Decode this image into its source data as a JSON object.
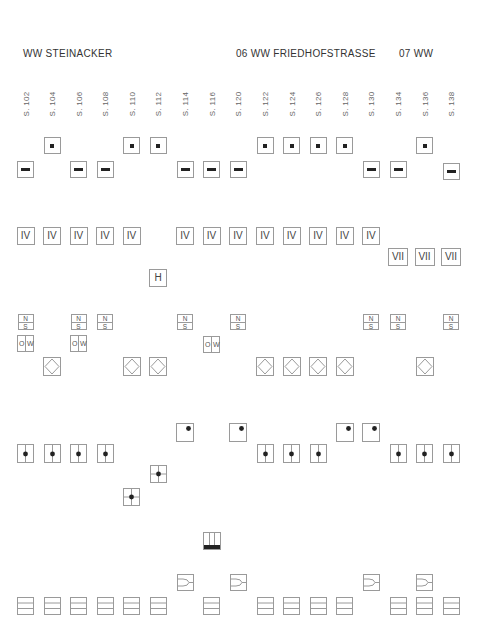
{
  "header": {
    "left_title": "WW  STEINACKER",
    "right_title": "06 WW FRIEDHOFSTRASSE",
    "right_suffix": "07 WW"
  },
  "columns": [
    "S. 102",
    "S. 104",
    "S. 106",
    "S. 108",
    "S. 110",
    "S. 112",
    "S. 114",
    "S. 116",
    "S. 120",
    "S. 122",
    "S. 124",
    "S. 126",
    "S. 128",
    "S. 130",
    "S. 134",
    "S. 136",
    "S. 138"
  ],
  "column_x": [
    25.5,
    52,
    78.5,
    105,
    131.5,
    158,
    185,
    211.5,
    238,
    265,
    291.5,
    318,
    344.5,
    371,
    398,
    424.5,
    451
  ],
  "rows": {
    "dot_top": {
      "symbol": "dot-square",
      "columns": [
        "S. 104",
        "S. 110",
        "S. 112",
        "S. 122",
        "S. 124",
        "S. 126",
        "S. 128",
        "S. 136"
      ]
    },
    "dash": {
      "symbol": "dash-square",
      "columns": [
        "S. 102",
        "S. 106",
        "S. 108",
        "S. 114",
        "S. 116",
        "S. 120",
        "S. 130",
        "S. 134",
        "S. 138"
      ]
    },
    "roman_iv": {
      "label": "IV",
      "columns": [
        "S. 102",
        "S. 104",
        "S. 106",
        "S. 108",
        "S. 110",
        "S. 114",
        "S. 116",
        "S. 120",
        "S. 122",
        "S. 124",
        "S. 126",
        "S. 128",
        "S. 130"
      ]
    },
    "roman_vii": {
      "label": "VII",
      "columns": [
        "S. 134",
        "S. 136",
        "S. 138"
      ]
    },
    "letter_h": {
      "label": "H",
      "columns": [
        "S. 112"
      ]
    },
    "north_south": {
      "top": "N",
      "bottom": "S",
      "columns": [
        "S. 102",
        "S. 106",
        "S. 108",
        "S. 114",
        "S. 120",
        "S. 130",
        "S. 134",
        "S. 138"
      ]
    },
    "east_west": {
      "left": "O",
      "right": "W",
      "columns": [
        "S. 102",
        "S. 106",
        "S. 116"
      ]
    },
    "diamond": {
      "symbol": "diamond-in-square",
      "columns": [
        "S. 104",
        "S. 110",
        "S. 112",
        "S. 122",
        "S. 124",
        "S. 126",
        "S. 128",
        "S. 136"
      ]
    },
    "corner_dot": {
      "symbol": "corner-dot-square",
      "columns": [
        "S. 114",
        "S. 120",
        "S. 128",
        "S. 130"
      ]
    },
    "split_dot": {
      "symbol": "split-dot-rect",
      "columns": [
        "S. 102",
        "S. 104",
        "S. 106",
        "S. 108",
        "S. 122",
        "S. 124",
        "S. 126",
        "S. 134",
        "S. 136",
        "S. 138"
      ]
    },
    "cross_dot": {
      "symbol": "cross-dot-square",
      "columns": [
        "S. 112",
        "S. 110"
      ]
    },
    "building": {
      "symbol": "building-bar",
      "columns": [
        "S. 116"
      ]
    },
    "gate": {
      "symbol": "gate-square",
      "columns": [
        "S. 114",
        "S. 120",
        "S. 130",
        "S. 136"
      ]
    },
    "stack": {
      "symbol": "three-band-rect",
      "columns": [
        "S. 102",
        "S. 104",
        "S. 106",
        "S. 108",
        "S. 110",
        "S. 112",
        "S. 116",
        "S. 122",
        "S. 124",
        "S. 126",
        "S. 128",
        "S. 134",
        "S. 136",
        "S. 138"
      ]
    }
  },
  "colors": {
    "stroke": "#9a9a9a",
    "fill_dark": "#222222",
    "text": "#333333"
  }
}
